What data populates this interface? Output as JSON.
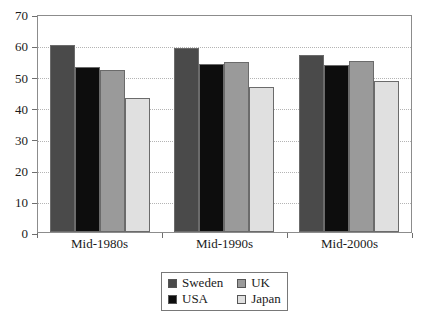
{
  "chart_data": {
    "type": "bar",
    "title": "",
    "subtitle": "",
    "xlabel": "",
    "ylabel": "",
    "categories": [
      "Mid-1980s",
      "Mid-1990s",
      "Mid-2000s"
    ],
    "series": [
      {
        "name": "Sweden",
        "color": "#4a4a4a",
        "values": [
          60,
          59,
          57
        ]
      },
      {
        "name": "USA",
        "color": "#0d0d0d",
        "values": [
          53,
          54,
          53.5
        ]
      },
      {
        "name": "UK",
        "color": "#9a9a9a",
        "values": [
          52,
          54.5,
          55
        ]
      },
      {
        "name": "Japan",
        "color": "#e0e0e0",
        "values": [
          43,
          46.5,
          48.5
        ]
      }
    ],
    "ylim": [
      0,
      70
    ],
    "ytick_step": 10,
    "yticks": [
      0,
      10,
      20,
      30,
      40,
      50,
      60,
      70
    ],
    "ytick_labels": [
      "0",
      "10",
      "20",
      "30",
      "40",
      "50",
      "60",
      "70"
    ],
    "grid": true,
    "grid_axis": "y",
    "grid_style": "dotted",
    "legend": true,
    "legend_position": "bottom-center",
    "legend_order": [
      "Sweden",
      "UK",
      "USA",
      "Japan"
    ],
    "plot_border": true,
    "background_color": "#ffffff"
  },
  "axis": {
    "y_labels": [
      "70",
      "60",
      "50",
      "40",
      "30",
      "20",
      "10",
      "0"
    ],
    "x_labels": [
      "Mid-1980s",
      "Mid-1990s",
      "Mid-2000s"
    ]
  },
  "legend": {
    "entries": [
      {
        "label": "Sweden",
        "color": "#4a4a4a"
      },
      {
        "label": "UK",
        "color": "#9a9a9a"
      },
      {
        "label": "USA",
        "color": "#0d0d0d"
      },
      {
        "label": "Japan",
        "color": "#e0e0e0"
      }
    ]
  }
}
